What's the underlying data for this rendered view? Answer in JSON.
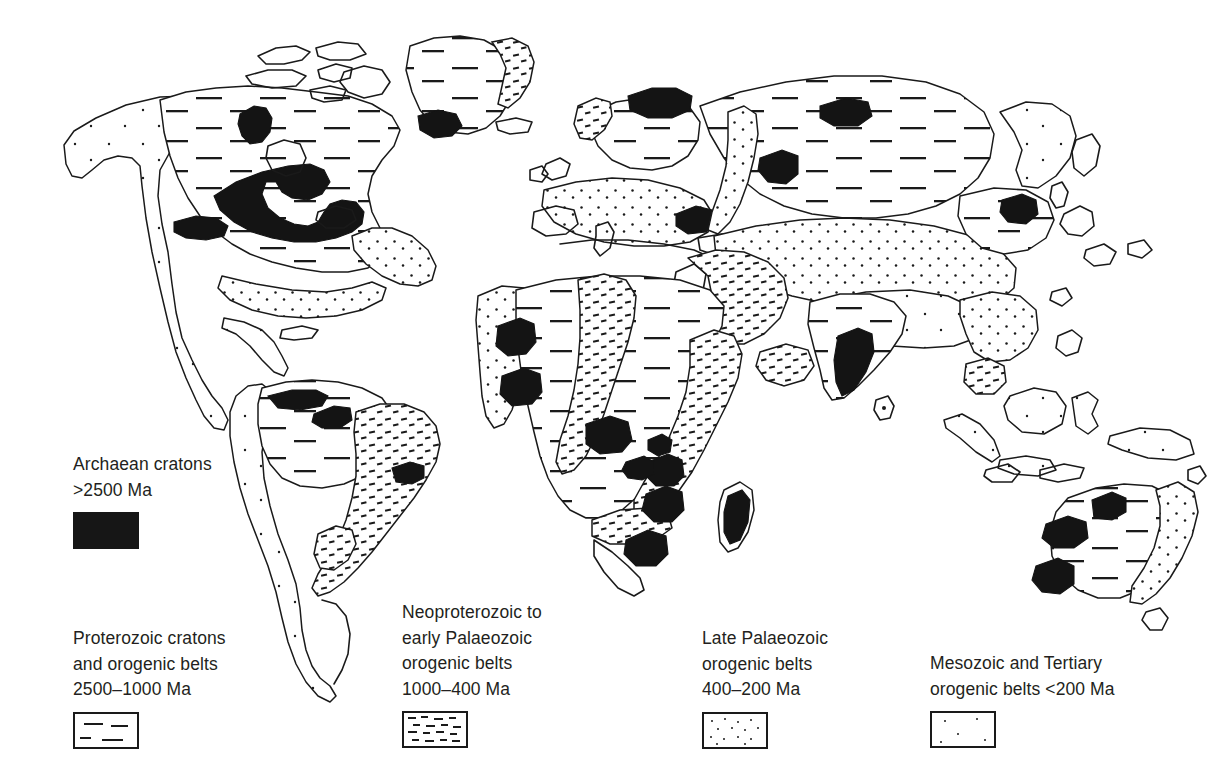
{
  "figure": {
    "kind": "geological-world-map"
  },
  "legend": {
    "items": [
      {
        "id": "archaean",
        "label": "Archaean cratons\n>2500 Ma",
        "age_range": ">2500 Ma",
        "name": "Archaean cratons",
        "swatch": "solid-black",
        "color": "#161616"
      },
      {
        "id": "proterozoic",
        "label": "Proterozoic cratons\nand orogenic belts\n2500–1000 Ma",
        "age_range": "2500–1000 Ma",
        "name": "Proterozoic cratons and orogenic belts",
        "swatch": "sparse-horizontal-dashes",
        "color": "#1a1a1a"
      },
      {
        "id": "neoproterozoic",
        "label": "Neoproterozoic to\nearly Palaeozoic\norogenic belts\n1000–400 Ma",
        "age_range": "1000–400 Ma",
        "name": "Neoproterozoic to early Palaeozoic orogenic belts",
        "swatch": "dense-short-dashes",
        "color": "#1a1a1a"
      },
      {
        "id": "late-palaeozoic",
        "label": "Late Palaeozoic\norogenic belts\n400–200 Ma",
        "age_range": "400–200 Ma",
        "name": "Late Palaeozoic orogenic belts",
        "swatch": "medium-stipple",
        "color": "#1a1a1a"
      },
      {
        "id": "mesozoic-tertiary",
        "label": "Mesozoic and Tertiary\norogenic belts <200 Ma",
        "age_range": "<200 Ma",
        "name": "Mesozoic and Tertiary orogenic belts",
        "swatch": "sparse-stipple",
        "color": "#1a1a1a"
      }
    ]
  },
  "map": {
    "regions": [
      {
        "name": "north-america",
        "classes": [
          "proterozoic",
          "archaean",
          "late-palaeozoic",
          "mesozoic-tertiary"
        ]
      },
      {
        "name": "greenland",
        "classes": [
          "proterozoic",
          "archaean",
          "neoproterozoic"
        ]
      },
      {
        "name": "south-america",
        "classes": [
          "proterozoic",
          "archaean",
          "neoproterozoic",
          "mesozoic-tertiary"
        ]
      },
      {
        "name": "africa",
        "classes": [
          "proterozoic",
          "archaean",
          "neoproterozoic",
          "late-palaeozoic"
        ]
      },
      {
        "name": "europe",
        "classes": [
          "proterozoic",
          "archaean",
          "late-palaeozoic",
          "neoproterozoic"
        ]
      },
      {
        "name": "asia",
        "classes": [
          "proterozoic",
          "archaean",
          "late-palaeozoic",
          "mesozoic-tertiary"
        ]
      },
      {
        "name": "india",
        "classes": [
          "proterozoic",
          "archaean"
        ]
      },
      {
        "name": "australia",
        "classes": [
          "proterozoic",
          "archaean",
          "late-palaeozoic"
        ]
      }
    ]
  }
}
